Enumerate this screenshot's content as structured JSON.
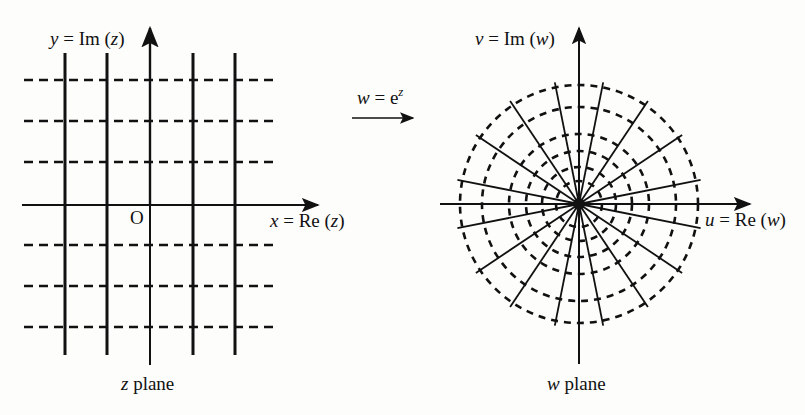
{
  "z_plane": {
    "y_axis_label_var": "y",
    "y_axis_label_rest": " = Im (",
    "y_axis_label_arg": "z",
    "y_axis_label_close": ")",
    "x_axis_label_var": "x",
    "x_axis_label_rest": " = Re (",
    "x_axis_label_arg": "z",
    "x_axis_label_close": ")",
    "origin_label": "O",
    "plane_label_var": "z",
    "plane_label_rest": " plane",
    "vertical_lines_x": [
      65,
      107,
      150,
      193,
      235
    ],
    "horizontal_dashed_y": [
      80,
      121,
      162,
      245,
      286,
      327
    ]
  },
  "mapping": {
    "label_var": "w",
    "label_eq": " = e",
    "label_exp": "z"
  },
  "w_plane": {
    "y_axis_label_var": "v",
    "y_axis_label_rest": " = Im (",
    "y_axis_label_arg": "w",
    "y_axis_label_close": ")",
    "x_axis_label_var": "u",
    "x_axis_label_rest": " = Re (",
    "x_axis_label_arg": "w",
    "x_axis_label_close": ")",
    "plane_label_var": "w",
    "plane_label_rest": " plane",
    "center": [
      579,
      204
    ],
    "circle_radii": [
      23,
      37,
      53,
      70,
      97,
      119
    ],
    "ray_count": 16,
    "ray_length": 124
  }
}
